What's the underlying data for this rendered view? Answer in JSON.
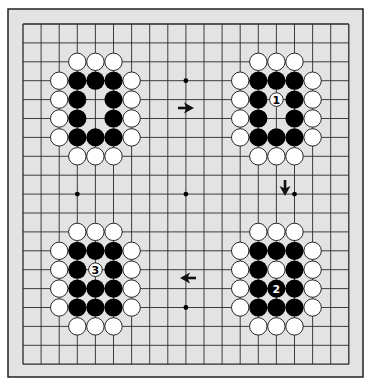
{
  "board": {
    "size": 19,
    "frame": {
      "x": 8,
      "y": 9,
      "width": 355,
      "height": 368,
      "color": "#222222",
      "fill": "#e3e3e3"
    },
    "grid": {
      "x0": 23,
      "y0": 24,
      "dx": 18.1,
      "dy": 18.9,
      "line_color": "#2a2a2a"
    },
    "colors": {
      "black_stone": "#000000",
      "white_stone": "#ffffff",
      "stone_outline": "#111111",
      "hoshi": "#000000",
      "arrow": "#111111"
    },
    "hoshi": [
      [
        9,
        3
      ],
      [
        3,
        9
      ],
      [
        9,
        9
      ],
      [
        15,
        9
      ],
      [
        9,
        15
      ]
    ],
    "groups": [
      {
        "name": "top-left",
        "white": [
          [
            3,
            2
          ],
          [
            4,
            2
          ],
          [
            5,
            2
          ],
          [
            2,
            3
          ],
          [
            2,
            4
          ],
          [
            2,
            5
          ],
          [
            2,
            6
          ],
          [
            6,
            3
          ],
          [
            6,
            4
          ],
          [
            6,
            5
          ],
          [
            6,
            6
          ],
          [
            3,
            7
          ],
          [
            4,
            7
          ],
          [
            5,
            7
          ]
        ],
        "black": [
          [
            3,
            3
          ],
          [
            4,
            3
          ],
          [
            5,
            3
          ],
          [
            3,
            4
          ],
          [
            5,
            4
          ],
          [
            3,
            5
          ],
          [
            5,
            5
          ],
          [
            3,
            6
          ],
          [
            4,
            6
          ],
          [
            5,
            6
          ]
        ]
      },
      {
        "name": "top-right",
        "white": [
          [
            13,
            2
          ],
          [
            14,
            2
          ],
          [
            15,
            2
          ],
          [
            12,
            3
          ],
          [
            12,
            4
          ],
          [
            12,
            5
          ],
          [
            12,
            6
          ],
          [
            16,
            3
          ],
          [
            16,
            4
          ],
          [
            16,
            5
          ],
          [
            16,
            6
          ],
          [
            13,
            7
          ],
          [
            14,
            7
          ],
          [
            15,
            7
          ]
        ],
        "black": [
          [
            13,
            3
          ],
          [
            14,
            3
          ],
          [
            15,
            3
          ],
          [
            13,
            4
          ],
          [
            15,
            4
          ],
          [
            13,
            5
          ],
          [
            15,
            5
          ],
          [
            13,
            6
          ],
          [
            14,
            6
          ],
          [
            15,
            6
          ]
        ]
      },
      {
        "name": "bottom-left",
        "white": [
          [
            3,
            11
          ],
          [
            4,
            11
          ],
          [
            5,
            11
          ],
          [
            2,
            12
          ],
          [
            2,
            13
          ],
          [
            2,
            14
          ],
          [
            2,
            15
          ],
          [
            6,
            12
          ],
          [
            6,
            13
          ],
          [
            6,
            14
          ],
          [
            6,
            15
          ],
          [
            3,
            16
          ],
          [
            4,
            16
          ],
          [
            5,
            16
          ]
        ],
        "black": [
          [
            3,
            12
          ],
          [
            4,
            12
          ],
          [
            5,
            12
          ],
          [
            3,
            13
          ],
          [
            5,
            13
          ],
          [
            3,
            14
          ],
          [
            4,
            14
          ],
          [
            5,
            14
          ],
          [
            3,
            15
          ],
          [
            4,
            15
          ],
          [
            5,
            15
          ]
        ]
      },
      {
        "name": "bottom-right",
        "white": [
          [
            13,
            11
          ],
          [
            14,
            11
          ],
          [
            15,
            11
          ],
          [
            12,
            12
          ],
          [
            12,
            13
          ],
          [
            12,
            14
          ],
          [
            12,
            15
          ],
          [
            16,
            12
          ],
          [
            16,
            13
          ],
          [
            16,
            14
          ],
          [
            16,
            15
          ],
          [
            13,
            16
          ],
          [
            14,
            16
          ],
          [
            15,
            16
          ],
          [
            14,
            13
          ]
        ],
        "black": [
          [
            13,
            12
          ],
          [
            14,
            12
          ],
          [
            15,
            12
          ],
          [
            13,
            13
          ],
          [
            15,
            13
          ],
          [
            13,
            14
          ],
          [
            15,
            14
          ],
          [
            13,
            15
          ],
          [
            14,
            15
          ],
          [
            15,
            15
          ]
        ]
      }
    ],
    "numbered_moves": [
      {
        "label": "1",
        "color": "white",
        "pos": [
          14,
          4
        ],
        "small": true
      },
      {
        "label": "2",
        "color": "black",
        "pos": [
          14,
          14
        ],
        "small": false
      },
      {
        "label": "3",
        "color": "white",
        "pos": [
          4,
          13
        ],
        "small": true
      }
    ],
    "arrows": [
      {
        "name": "arrow-right",
        "direction": "right",
        "cx": 186,
        "cy": 108
      },
      {
        "name": "arrow-down",
        "direction": "down",
        "cx": 285,
        "cy": 188
      },
      {
        "name": "arrow-left",
        "direction": "left",
        "cx": 188,
        "cy": 278
      }
    ]
  }
}
